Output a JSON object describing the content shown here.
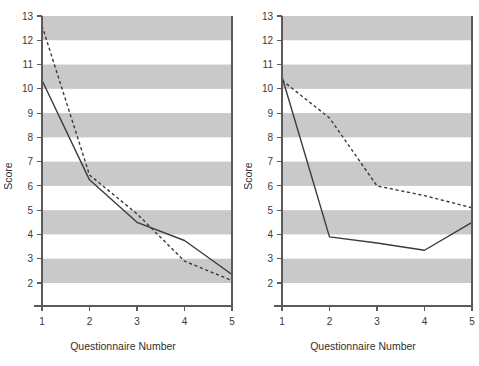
{
  "figure": {
    "background": "#ffffff",
    "band_color": "#c9c9c9",
    "line_color": "#3b3b3b",
    "axis_color": "#5a5a5a"
  },
  "chart_data": [
    {
      "type": "line",
      "panel": "left",
      "title": "",
      "xlabel": "Questionnaire Number",
      "ylabel": "Score",
      "x": [
        1,
        2,
        3,
        4,
        5
      ],
      "xticklabels": [
        "1",
        "2",
        "3",
        "4",
        "5"
      ],
      "yticks": [
        2,
        3,
        4,
        5,
        6,
        7,
        8,
        9,
        10,
        11,
        12,
        13
      ],
      "yticklabels": [
        "2",
        "3",
        "4",
        "5",
        "6",
        "7",
        "8",
        "9",
        "10",
        "11",
        "12",
        "13"
      ],
      "xlim": [
        1,
        5
      ],
      "ylim": [
        1.5,
        13
      ],
      "grid": false,
      "banded_background": true,
      "band_ranges": [
        [
          12,
          13
        ],
        [
          10,
          11
        ],
        [
          8,
          9
        ],
        [
          6,
          7
        ],
        [
          4,
          5
        ],
        [
          2,
          3
        ]
      ],
      "legend": "none",
      "series": [
        {
          "name": "Series 1",
          "style": "solid",
          "values": [
            10.35,
            6.25,
            4.5,
            3.75,
            2.35
          ]
        },
        {
          "name": "Series 2",
          "style": "dashed",
          "values": [
            12.6,
            6.45,
            4.85,
            2.9,
            2.1
          ]
        }
      ]
    },
    {
      "type": "line",
      "panel": "right",
      "title": "",
      "xlabel": "Questionnaire Number",
      "ylabel": "Score",
      "x": [
        1,
        2,
        3,
        4,
        5
      ],
      "xticklabels": [
        "1",
        "2",
        "3",
        "4",
        "5"
      ],
      "yticks": [
        2,
        3,
        4,
        5,
        6,
        7,
        8,
        9,
        10,
        11,
        12,
        13
      ],
      "yticklabels": [
        "2",
        "3",
        "4",
        "5",
        "6",
        "7",
        "8",
        "9",
        "10",
        "11",
        "12",
        "13"
      ],
      "xlim": [
        1,
        5
      ],
      "ylim": [
        1.5,
        13
      ],
      "grid": false,
      "banded_background": true,
      "band_ranges": [
        [
          12,
          13
        ],
        [
          10,
          11
        ],
        [
          8,
          9
        ],
        [
          6,
          7
        ],
        [
          4,
          5
        ],
        [
          2,
          3
        ]
      ],
      "legend": "none",
      "series": [
        {
          "name": "Series 1",
          "style": "solid",
          "values": [
            10.5,
            3.9,
            3.65,
            3.35,
            4.5
          ]
        },
        {
          "name": "Series 2",
          "style": "dashed",
          "values": [
            10.35,
            8.8,
            6.0,
            5.6,
            5.1
          ]
        }
      ]
    }
  ]
}
